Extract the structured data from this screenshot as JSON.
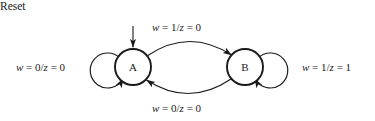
{
  "diagram": {
    "kind": "finite-state-machine",
    "background_color": "#ffffff",
    "stroke_color": "#1a1a1a",
    "reset": {
      "label": "Reset",
      "target_state": "A"
    },
    "states": [
      {
        "id": "A",
        "label": "A",
        "cx": 133,
        "cy": 67,
        "r": 18
      },
      {
        "id": "B",
        "label": "B",
        "cx": 245,
        "cy": 67,
        "r": 18
      }
    ],
    "transitions": [
      {
        "id": "a-self",
        "from": "A",
        "to": "A",
        "position": "left",
        "condition": "w = 0",
        "output": "z = 0",
        "label_parts": {
          "var1": "w",
          "eq1": " = 0/",
          "var2": "z",
          "eq2": " = 0"
        },
        "label": "w = 0/z = 0"
      },
      {
        "id": "a-to-b",
        "from": "A",
        "to": "B",
        "position": "top",
        "condition": "w = 1",
        "output": "z = 0",
        "label_parts": {
          "var1": "w",
          "eq1": " = 1/",
          "var2": "z",
          "eq2": " = 0"
        },
        "label": "w = 1/z = 0"
      },
      {
        "id": "b-to-a",
        "from": "B",
        "to": "A",
        "position": "bottom",
        "condition": "w = 0",
        "output": "z = 0",
        "label_parts": {
          "var1": "w",
          "eq1": " = 0/",
          "var2": "z",
          "eq2": " = 0"
        },
        "label": "w = 0/z = 0"
      },
      {
        "id": "b-self",
        "from": "B",
        "to": "B",
        "position": "right",
        "condition": "w = 1",
        "output": "z = 1",
        "label_parts": {
          "var1": "w",
          "eq1": " = 1/",
          "var2": "z",
          "eq2": " = 1"
        },
        "label": "w = 1/z = 1"
      }
    ]
  }
}
